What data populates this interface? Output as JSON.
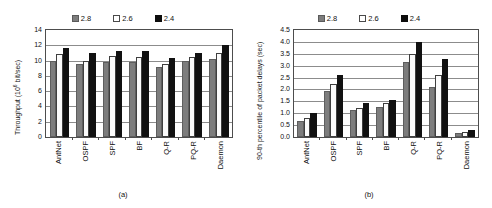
{
  "figures": [
    {
      "caption": "(a)",
      "legend": [
        {
          "label": "2.8",
          "swatch": "gray-square-icon"
        },
        {
          "label": "2.6",
          "swatch": "white-square-icon"
        },
        {
          "label": "2.4",
          "swatch": "black-square-icon"
        }
      ],
      "ylabel_main": "Throughput (10",
      "ylabel_sup": "6",
      "ylabel_tail": " bit/sec)"
    },
    {
      "caption": "(b)",
      "legend": [
        {
          "label": "2.8",
          "swatch": "gray-square-icon"
        },
        {
          "label": "2.6",
          "swatch": "white-square-icon"
        },
        {
          "label": "2.4",
          "swatch": "black-square-icon"
        }
      ],
      "ylabel_main": "90-th percentile of packet delays (sec)",
      "ylabel_sup": "",
      "ylabel_tail": ""
    }
  ],
  "chart_data": [
    {
      "type": "bar",
      "title": "",
      "panel": "(a)",
      "xlabel": "",
      "ylabel": "Throughput (10^6 bit/sec)",
      "ylim": [
        0,
        14
      ],
      "yticks": [
        0,
        2,
        4,
        6,
        8,
        10,
        12,
        14
      ],
      "ytick_labels": [
        "0",
        "2",
        "4",
        "6",
        "8",
        "10",
        "12",
        "14"
      ],
      "grid": true,
      "legend_position": "top-center",
      "categories": [
        "AntNet",
        "OSPF",
        "SPF",
        "BF",
        "Q-R",
        "PQ-R",
        "Daemon"
      ],
      "series": [
        {
          "name": "2.8",
          "color": "#7d7d7d",
          "values": [
            10.0,
            9.55,
            9.85,
            9.75,
            9.2,
            9.95,
            10.2
          ]
        },
        {
          "name": "2.6",
          "color": "#fbfbfb",
          "values": [
            10.8,
            10.0,
            10.55,
            10.45,
            9.6,
            10.45,
            11.05
          ]
        },
        {
          "name": "2.4",
          "color": "#111111",
          "values": [
            11.65,
            10.95,
            11.3,
            11.2,
            10.4,
            10.95,
            12.0
          ]
        }
      ]
    },
    {
      "type": "bar",
      "title": "",
      "panel": "(b)",
      "xlabel": "",
      "ylabel": "90-th percentile of packet delays (sec)",
      "ylim": [
        0,
        4.5
      ],
      "yticks": [
        0.0,
        0.5,
        1.0,
        1.5,
        2.0,
        2.5,
        3.0,
        3.5,
        4.0,
        4.5
      ],
      "ytick_labels": [
        "0.0",
        "0.5",
        "1.0",
        "1.5",
        "2.0",
        "2.5",
        "3.0",
        "3.5",
        "4.0",
        "4.5"
      ],
      "grid": true,
      "legend_position": "top-center",
      "categories": [
        "AntNet",
        "OSPF",
        "SPF",
        "BF",
        "Q-R",
        "PQ-R",
        "Daemon"
      ],
      "series": [
        {
          "name": "2.8",
          "color": "#7d7d7d",
          "values": [
            0.68,
            1.95,
            1.12,
            1.28,
            3.15,
            2.12,
            0.15
          ]
        },
        {
          "name": "2.6",
          "color": "#fbfbfb",
          "values": [
            0.82,
            2.25,
            1.22,
            1.42,
            3.5,
            2.6,
            0.2
          ]
        },
        {
          "name": "2.4",
          "color": "#111111",
          "values": [
            1.0,
            2.62,
            1.42,
            1.57,
            4.0,
            3.28,
            0.3
          ]
        }
      ]
    }
  ]
}
